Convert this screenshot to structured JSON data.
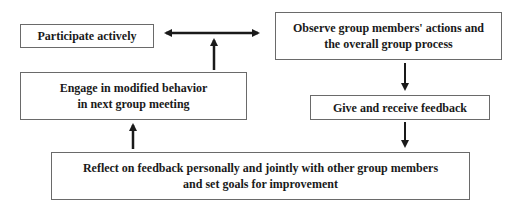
{
  "diagram": {
    "nodes": {
      "participate": {
        "label": "Participate actively"
      },
      "observe": {
        "line1": "Observe group members' actions and",
        "line2": "the overall group process"
      },
      "feedback": {
        "label": "Give and receive feedback"
      },
      "reflect": {
        "line1": "Reflect on feedback personally and jointly with other group members",
        "line2": "and set goals for improvement"
      },
      "engage": {
        "line1": "Engage in modified behavior",
        "line2": "in next group meeting"
      }
    },
    "edges": [
      {
        "from": "participate",
        "to": "observe",
        "type": "bidirectional"
      },
      {
        "from": "engage",
        "to": "participate-observe-link",
        "type": "arrow-up"
      },
      {
        "from": "observe",
        "to": "feedback",
        "type": "arrow-down"
      },
      {
        "from": "feedback",
        "to": "reflect",
        "type": "arrow-down"
      },
      {
        "from": "reflect",
        "to": "engage",
        "type": "arrow-up"
      }
    ],
    "colors": {
      "stroke": "#1a1a1a",
      "border": "#6a6a6a",
      "background": "#ffffff"
    }
  }
}
